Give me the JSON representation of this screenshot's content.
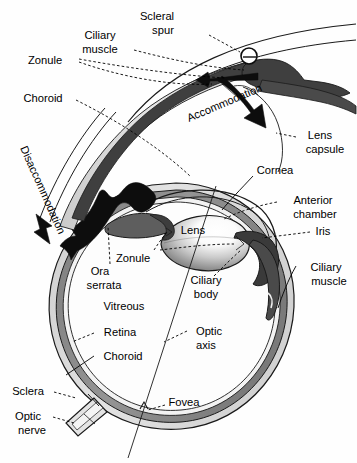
{
  "figure": {
    "background_color": "#fefefe",
    "width": 357,
    "height": 463
  },
  "colors": {
    "outline": "#1a1a1a",
    "sclera_fill": "#d8d8d8",
    "choroid_fill": "#8a8a8a",
    "retina_fill": "#efefef",
    "ciliary_muscle_fill": "#5a5a5a",
    "iris_fill": "#3a3a3a",
    "lens_highlight": "#ffffff",
    "lens_shadow": "#6e6e6e",
    "arrow_black": "#0d0d0d",
    "label_text": "#000000"
  },
  "labels": {
    "scleral_spur": "Scleral\nspur",
    "scleral_spur_line1": "Scleral",
    "scleral_spur_line2": "spur",
    "ciliary_muscle_top_line1": "Ciliary",
    "ciliary_muscle_top_line2": "muscle",
    "zonule_top": "Zonule",
    "choroid_top": "Choroid",
    "accommodation": "Accommodation",
    "lens_capsule_line1": "Lens",
    "lens_capsule_line2": "capsule",
    "disaccommodation": "Disaccommodation",
    "cornea": "Cornea",
    "anterior_chamber_line1": "Anterior",
    "anterior_chamber_line2": "chamber",
    "iris": "Iris",
    "lens": "Lens",
    "zonule_mid": "Zonule",
    "ora_serrata_line1": "Ora",
    "ora_serrata_line2": "serrata",
    "ciliary_body_line1": "Ciliary",
    "ciliary_body_line2": "body",
    "ciliary_muscle_right_line1": "Ciliary",
    "ciliary_muscle_right_line2": "muscle",
    "vitreous": "Vitreous",
    "retina": "Retina",
    "choroid_lower": "Choroid",
    "optic_axis_line1": "Optic",
    "optic_axis_line2": "axis",
    "sclera": "Sclera",
    "optic_nerve_line1": "Optic",
    "optic_nerve_line2": "nerve",
    "fovea": "Fovea"
  },
  "structures": [
    {
      "name": "scleral-spur",
      "kind": "annotated-point",
      "marker": "circle-with-tick"
    },
    {
      "name": "ciliary-muscle",
      "kind": "muscle",
      "shown_twice": true
    },
    {
      "name": "zonule",
      "kind": "fiber",
      "shown_twice": true
    },
    {
      "name": "choroid",
      "kind": "layer",
      "shown_twice": true
    },
    {
      "name": "lens-capsule",
      "kind": "membrane"
    },
    {
      "name": "cornea",
      "kind": "layer"
    },
    {
      "name": "anterior-chamber",
      "kind": "cavity"
    },
    {
      "name": "iris",
      "kind": "diaphragm"
    },
    {
      "name": "lens",
      "kind": "optical-element"
    },
    {
      "name": "ora-serrata",
      "kind": "boundary"
    },
    {
      "name": "ciliary-body",
      "kind": "tissue"
    },
    {
      "name": "vitreous",
      "kind": "cavity"
    },
    {
      "name": "retina",
      "kind": "layer"
    },
    {
      "name": "sclera",
      "kind": "layer"
    },
    {
      "name": "optic-nerve",
      "kind": "nerve"
    },
    {
      "name": "fovea",
      "kind": "landmark"
    },
    {
      "name": "optic-axis",
      "kind": "reference-line"
    }
  ],
  "arrows": [
    {
      "name": "accommodation-arrow",
      "label": "Accommodation",
      "style": "thick-black-curved",
      "direction": "inward-down-right"
    },
    {
      "name": "disaccommodation-arrow",
      "label": "Disaccommodation",
      "style": "thin-outline-curved",
      "direction": "down-left"
    },
    {
      "name": "disaccommodation-wave-arrow",
      "label": "",
      "style": "thick-black-wavy",
      "direction": "left"
    },
    {
      "name": "zonule-tension-arrow",
      "label": "",
      "style": "thick-black-straight",
      "direction": "left"
    }
  ]
}
